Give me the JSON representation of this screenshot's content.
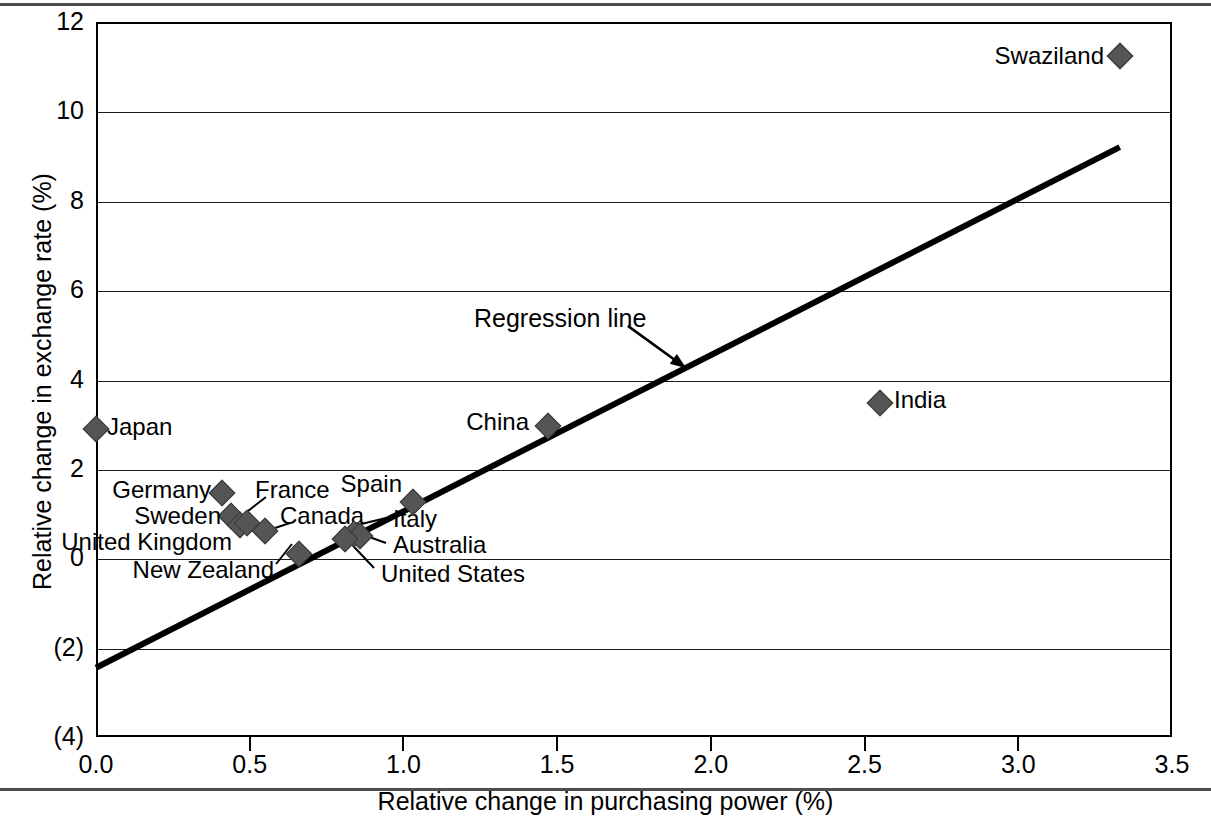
{
  "figure": {
    "has_top_rule": true,
    "has_bottom_rule": true,
    "background": "#ffffff",
    "marker_color": "#555555",
    "line_color": "#000000"
  },
  "chart_data": {
    "type": "scatter",
    "title": "",
    "xlabel": "Relative change in purchasing power (%)",
    "ylabel": "Relative change in exchange rate (%)",
    "xlim": [
      0.0,
      3.5
    ],
    "ylim": [
      -4,
      12
    ],
    "xticks": [
      "0.0",
      "0.5",
      "1.0",
      "1.5",
      "2.0",
      "2.5",
      "3.0",
      "3.5"
    ],
    "xtick_values": [
      0.0,
      0.5,
      1.0,
      1.5,
      2.0,
      2.5,
      3.0,
      3.5
    ],
    "yticks": [
      "12",
      "10",
      "8",
      "6",
      "4",
      "2",
      "0",
      "(2)",
      "(4)"
    ],
    "ytick_values": [
      12,
      10,
      8,
      6,
      4,
      2,
      0,
      -2,
      -4
    ],
    "grid": "horizontal",
    "legend": "none",
    "points": [
      {
        "name": "Japan",
        "x": 0.0,
        "y": 2.9,
        "label_side": "right",
        "label_dx": 16,
        "label_dy": 0
      },
      {
        "name": "Germany",
        "x": 0.41,
        "y": 1.45,
        "label_side": "left",
        "label_dx": -14,
        "label_dy": 0
      },
      {
        "name": "Sweden",
        "x": 0.44,
        "y": 0.95,
        "label_side": "left",
        "label_dx": -14,
        "label_dy": 0
      },
      {
        "name": "United Kingdom",
        "x": 0.47,
        "y": 0.75,
        "label_side": "left",
        "label_dx": -20,
        "label_dy": 12
      },
      {
        "name": "France",
        "x": 0.49,
        "y": 0.8,
        "label_side": "right",
        "label_dx": 0,
        "label_dy": 0
      },
      {
        "name": "Canada",
        "x": 0.55,
        "y": 0.6,
        "label_side": "right",
        "label_dx": 0,
        "label_dy": 0
      },
      {
        "name": "New Zealand",
        "x": 0.66,
        "y": 0.1,
        "label_side": "left",
        "label_dx": 0,
        "label_dy": 0
      },
      {
        "name": "Italy",
        "x": 0.84,
        "y": 0.55,
        "label_side": "right",
        "label_dx": 0,
        "label_dy": 0
      },
      {
        "name": "Australia",
        "x": 0.86,
        "y": 0.5,
        "label_side": "right",
        "label_dx": 0,
        "label_dy": 0
      },
      {
        "name": "United States",
        "x": 0.81,
        "y": 0.42,
        "label_side": "right",
        "label_dx": 0,
        "label_dy": 0
      },
      {
        "name": "Spain",
        "x": 1.03,
        "y": 1.25,
        "label_side": "left",
        "label_dx": 0,
        "label_dy": 0
      },
      {
        "name": "China",
        "x": 1.47,
        "y": 2.95,
        "label_side": "left",
        "label_dx": -14,
        "label_dy": 0
      },
      {
        "name": "India",
        "x": 2.55,
        "y": 3.48,
        "label_side": "right",
        "label_dx": 16,
        "label_dy": 0
      },
      {
        "name": "Swaziland",
        "x": 3.33,
        "y": 11.25,
        "label_side": "left",
        "label_dx": -14,
        "label_dy": 0
      }
    ],
    "regression_line": {
      "label": "Regression line",
      "x_start": 0.0,
      "y_start": -2.45,
      "x_end": 3.33,
      "y_end": 9.2,
      "slope": 3.5,
      "intercept": -2.45
    },
    "annotations": [
      {
        "text": "Regression line",
        "arrow_from_x": 1.73,
        "arrow_from_y": 5.2,
        "arrow_to_x": 1.92,
        "arrow_to_y": 4.25
      }
    ]
  }
}
